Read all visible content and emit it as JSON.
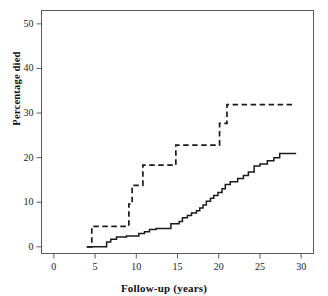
{
  "chart_data": {
    "type": "line",
    "title": "",
    "xlabel": "Follow-up (years)",
    "ylabel": "Percentage died",
    "xlim": [
      -1.5,
      31.5
    ],
    "ylim": [
      -1.5,
      53
    ],
    "xticks": [
      0,
      5,
      10,
      15,
      20,
      25,
      30
    ],
    "xtick_labels": [
      "0",
      "5",
      "10",
      "15",
      "20",
      "25",
      "30"
    ],
    "yticks": [
      0,
      10,
      20,
      30,
      40,
      50
    ],
    "ytick_labels": [
      "0",
      "10",
      "20",
      "30",
      "40",
      "50"
    ],
    "grid": false,
    "legend": "none",
    "frame": "box",
    "series": [
      {
        "name": "dashed-group",
        "style": "dashed",
        "color": "#1a1a1a",
        "step": "post",
        "points": [
          [
            4.0,
            0.0
          ],
          [
            4.6,
            0.0
          ],
          [
            4.6,
            4.6
          ],
          [
            9.1,
            4.6
          ],
          [
            9.1,
            9.6
          ],
          [
            9.5,
            9.6
          ],
          [
            9.5,
            13.8
          ],
          [
            10.8,
            13.8
          ],
          [
            10.8,
            18.3
          ],
          [
            14.8,
            18.3
          ],
          [
            14.8,
            22.8
          ],
          [
            20.1,
            22.8
          ],
          [
            20.1,
            27.7
          ],
          [
            21.0,
            27.7
          ],
          [
            21.0,
            31.9
          ],
          [
            29.2,
            31.9
          ]
        ]
      },
      {
        "name": "solid-group",
        "style": "solid",
        "color": "#1a1a1a",
        "step": "post",
        "points": [
          [
            4.0,
            0.0
          ],
          [
            6.4,
            0.0
          ],
          [
            6.4,
            1.1
          ],
          [
            6.9,
            1.1
          ],
          [
            6.9,
            1.7
          ],
          [
            7.6,
            1.7
          ],
          [
            7.6,
            2.2
          ],
          [
            8.8,
            2.2
          ],
          [
            8.8,
            2.4
          ],
          [
            10.3,
            2.4
          ],
          [
            10.3,
            3.0
          ],
          [
            11.0,
            3.0
          ],
          [
            11.0,
            3.4
          ],
          [
            11.6,
            3.4
          ],
          [
            11.6,
            3.9
          ],
          [
            12.4,
            3.9
          ],
          [
            12.4,
            4.1
          ],
          [
            14.2,
            4.1
          ],
          [
            14.2,
            5.2
          ],
          [
            15.2,
            5.2
          ],
          [
            15.2,
            5.7
          ],
          [
            15.6,
            5.7
          ],
          [
            15.6,
            6.5
          ],
          [
            16.2,
            6.5
          ],
          [
            16.2,
            7.0
          ],
          [
            16.7,
            7.0
          ],
          [
            16.7,
            7.6
          ],
          [
            17.3,
            7.6
          ],
          [
            17.3,
            8.1
          ],
          [
            17.7,
            8.1
          ],
          [
            17.7,
            8.7
          ],
          [
            18.1,
            8.7
          ],
          [
            18.1,
            9.4
          ],
          [
            18.5,
            9.4
          ],
          [
            18.5,
            10.2
          ],
          [
            19.0,
            10.2
          ],
          [
            19.0,
            10.9
          ],
          [
            19.4,
            10.9
          ],
          [
            19.4,
            11.5
          ],
          [
            19.9,
            11.5
          ],
          [
            19.9,
            12.2
          ],
          [
            20.4,
            12.2
          ],
          [
            20.4,
            13.0
          ],
          [
            20.8,
            13.0
          ],
          [
            20.8,
            14.0
          ],
          [
            21.4,
            14.0
          ],
          [
            21.4,
            14.6
          ],
          [
            22.3,
            14.6
          ],
          [
            22.3,
            15.3
          ],
          [
            23.0,
            15.3
          ],
          [
            23.0,
            16.0
          ],
          [
            23.6,
            16.0
          ],
          [
            23.6,
            16.8
          ],
          [
            24.3,
            16.8
          ],
          [
            24.3,
            18.1
          ],
          [
            25.0,
            18.1
          ],
          [
            25.0,
            18.6
          ],
          [
            25.9,
            18.6
          ],
          [
            25.9,
            19.3
          ],
          [
            26.7,
            19.3
          ],
          [
            26.7,
            20.0
          ],
          [
            27.4,
            20.0
          ],
          [
            27.4,
            20.9
          ],
          [
            29.4,
            20.9
          ]
        ]
      }
    ]
  }
}
